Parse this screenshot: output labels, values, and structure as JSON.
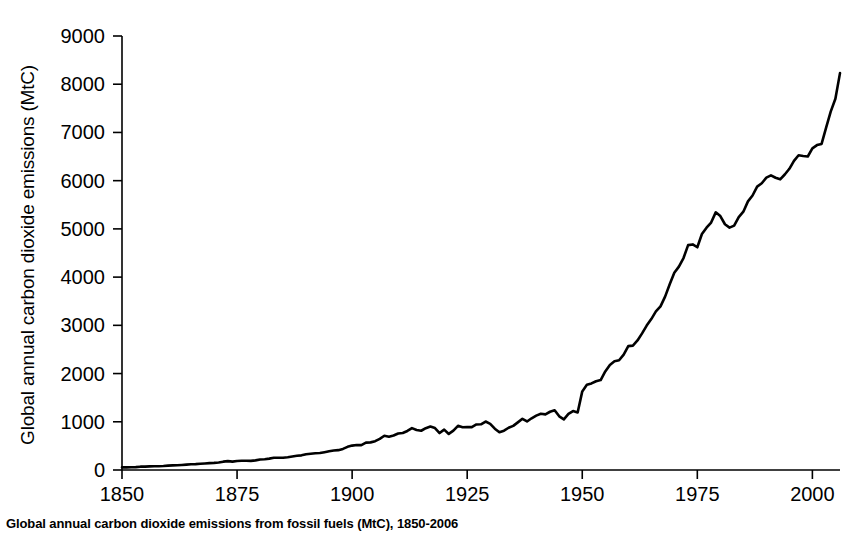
{
  "figure": {
    "caption": "Global annual carbon dioxide emissions from fossil fuels (MtC), 1850-2006"
  },
  "chart_data": {
    "type": "line",
    "title": "",
    "xlabel": "",
    "ylabel": "Global annual carbon dioxide emissions (MtC)",
    "xlim": [
      1850,
      2006
    ],
    "ylim": [
      0,
      9000
    ],
    "grid": false,
    "legend": null,
    "line_color": "#000000",
    "line_width": 2.6,
    "xticks": [
      1850,
      1875,
      1900,
      1925,
      1950,
      1975,
      2000
    ],
    "xtick_labels": [
      "1850",
      "1875",
      "1900",
      "1925",
      "1950",
      "1975",
      "2000"
    ],
    "yticks": [
      0,
      1000,
      2000,
      3000,
      4000,
      5000,
      6000,
      7000,
      8000,
      9000
    ],
    "ytick_labels": [
      "0",
      "1000",
      "2000",
      "3000",
      "4000",
      "5000",
      "6000",
      "7000",
      "8000",
      "9000"
    ],
    "series": [
      {
        "name": "Global annual CO2 emissions from fossil fuels",
        "units": "MtC",
        "x": [
          1850,
          1851,
          1852,
          1853,
          1854,
          1855,
          1856,
          1857,
          1858,
          1859,
          1860,
          1861,
          1862,
          1863,
          1864,
          1865,
          1866,
          1867,
          1868,
          1869,
          1870,
          1871,
          1872,
          1873,
          1874,
          1875,
          1876,
          1877,
          1878,
          1879,
          1880,
          1881,
          1882,
          1883,
          1884,
          1885,
          1886,
          1887,
          1888,
          1889,
          1890,
          1891,
          1892,
          1893,
          1894,
          1895,
          1896,
          1897,
          1898,
          1899,
          1900,
          1901,
          1902,
          1903,
          1904,
          1905,
          1906,
          1907,
          1908,
          1909,
          1910,
          1911,
          1912,
          1913,
          1914,
          1915,
          1916,
          1917,
          1918,
          1919,
          1920,
          1921,
          1922,
          1923,
          1924,
          1925,
          1926,
          1927,
          1928,
          1929,
          1930,
          1931,
          1932,
          1933,
          1934,
          1935,
          1936,
          1937,
          1938,
          1939,
          1940,
          1941,
          1942,
          1943,
          1944,
          1945,
          1946,
          1947,
          1948,
          1949,
          1950,
          1951,
          1952,
          1953,
          1954,
          1955,
          1956,
          1957,
          1958,
          1959,
          1960,
          1961,
          1962,
          1963,
          1964,
          1965,
          1966,
          1967,
          1968,
          1969,
          1970,
          1971,
          1972,
          1973,
          1974,
          1975,
          1976,
          1977,
          1978,
          1979,
          1980,
          1981,
          1982,
          1983,
          1984,
          1985,
          1986,
          1987,
          1988,
          1989,
          1990,
          1991,
          1992,
          1993,
          1994,
          1995,
          1996,
          1997,
          1998,
          1999,
          2000,
          2001,
          2002,
          2003,
          2004,
          2005,
          2006
        ],
        "values": [
          54,
          54,
          57,
          59,
          69,
          71,
          76,
          77,
          78,
          83,
          91,
          95,
          97,
          104,
          112,
          119,
          122,
          130,
          135,
          142,
          147,
          156,
          173,
          184,
          174,
          188,
          191,
          193,
          190,
          199,
          217,
          223,
          236,
          253,
          253,
          255,
          264,
          279,
          294,
          304,
          325,
          337,
          346,
          351,
          370,
          387,
          403,
          412,
          438,
          480,
          506,
          517,
          516,
          567,
          573,
          598,
          647,
          711,
          690,
          715,
          756,
          768,
          810,
          869,
          830,
          814,
          867,
          900,
          870,
          766,
          838,
          748,
          816,
          917,
          887,
          893,
          890,
          945,
          948,
          1005,
          958,
          857,
          783,
          815,
          876,
          915,
          988,
          1061,
          1006,
          1073,
          1128,
          1165,
          1153,
          1208,
          1239,
          1113,
          1051,
          1164,
          1223,
          1194,
          1630,
          1767,
          1795,
          1841,
          1865,
          2043,
          2179,
          2257,
          2276,
          2394,
          2569,
          2580,
          2686,
          2833,
          2995,
          3130,
          3288,
          3393,
          3596,
          3853,
          4090,
          4217,
          4395,
          4664,
          4678,
          4619,
          4893,
          5025,
          5131,
          5343,
          5266,
          5096,
          5027,
          5068,
          5246,
          5357,
          5571,
          5692,
          5877,
          5946,
          6063,
          6109,
          6060,
          6028,
          6128,
          6246,
          6412,
          6528,
          6513,
          6501,
          6670,
          6738,
          6762,
          7106,
          7436,
          7699,
          8230
        ]
      }
    ],
    "annotations": [
      {
        "label": "WWI dip",
        "x": 1918,
        "y": 766
      },
      {
        "label": "Great Depression dip",
        "x": 1932,
        "y": 783
      },
      {
        "label": "WWII end dip",
        "x": 1945,
        "y": 1113
      },
      {
        "label": "Oil shock plateau",
        "x": 1982,
        "y": 5027
      },
      {
        "label": "Early 1990s plateau",
        "x": 1993,
        "y": 6028
      }
    ]
  }
}
